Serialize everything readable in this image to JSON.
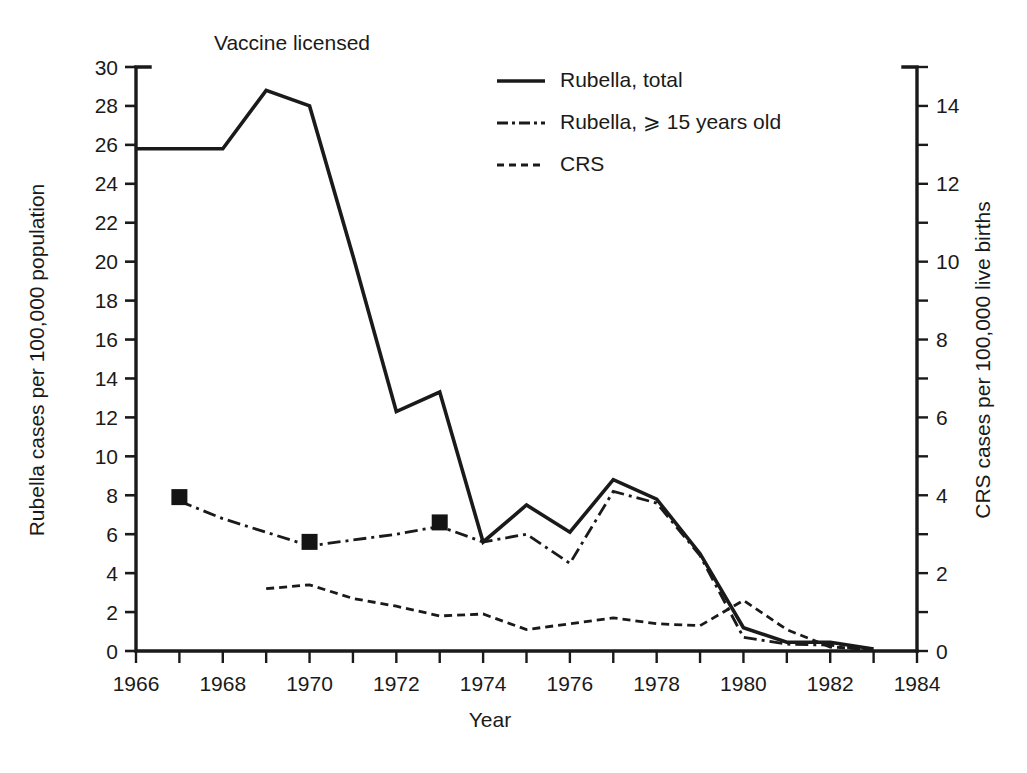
{
  "figure": {
    "annotation": "Vaccine licensed",
    "annotation_x_year": 1968.45
  },
  "axes": {
    "x": {
      "title": "Year",
      "ticks": [
        1966,
        1968,
        1970,
        1972,
        1974,
        1976,
        1978,
        1980,
        1982,
        1984
      ],
      "tick_labels": [
        "1966",
        "1968",
        "1970",
        "1972",
        "1974",
        "1976",
        "1978",
        "1980",
        "1982",
        "1984"
      ],
      "range": [
        1966,
        1984
      ],
      "minor_step": 1
    },
    "y_left": {
      "title": "Rubella cases per 100,000 population",
      "ticks": [
        0,
        2,
        4,
        6,
        8,
        10,
        12,
        14,
        16,
        18,
        20,
        22,
        24,
        26,
        28,
        30
      ],
      "tick_labels": [
        "0",
        "2",
        "4",
        "6",
        "8",
        "10",
        "12",
        "14",
        "16",
        "18",
        "20",
        "22",
        "24",
        "26",
        "28",
        "30"
      ],
      "range": [
        0,
        30
      ]
    },
    "y_right": {
      "title": "CRS cases per 100,000 live births",
      "ticks": [
        0,
        2,
        4,
        6,
        8,
        10,
        12,
        14
      ],
      "tick_labels": [
        "0",
        "2",
        "4",
        "6",
        "8",
        "10",
        "12",
        "14"
      ],
      "range": [
        0,
        15
      ],
      "minor_step": 1
    }
  },
  "legend": {
    "position": "top-right-inside",
    "entries": [
      {
        "label": "Rubella,  total",
        "style": "solid",
        "axis": "left"
      },
      {
        "label": "Rubella, ⩾ 15 years old",
        "style": "dash-dot",
        "axis": "left"
      },
      {
        "label": "CRS",
        "style": "dotted",
        "axis": "right"
      }
    ]
  },
  "colors": {
    "ink": "#1a1a1a",
    "background": "#ffffff"
  },
  "chart_data": {
    "type": "line",
    "title": "",
    "subtitle": "",
    "xlabel": "Year",
    "ylabel": "Rubella cases per 100,000 population",
    "ylabel_right": "CRS cases per 100,000 live births",
    "xlim": [
      1966,
      1984
    ],
    "ylim": [
      0,
      30
    ],
    "ylim_right": [
      0,
      15
    ],
    "grid": false,
    "legend_position": "upper right",
    "annotations": [
      {
        "text": "Vaccine licensed",
        "x": 1968.45,
        "y": 30.9
      }
    ],
    "x": [
      1966,
      1967,
      1968,
      1969,
      1970,
      1971,
      1972,
      1973,
      1974,
      1975,
      1976,
      1977,
      1978,
      1979,
      1980,
      1981,
      1982,
      1983
    ],
    "series": [
      {
        "name": "Rubella,  total",
        "style": "solid",
        "axis": "left",
        "units": "cases per 100,000 population",
        "x": [
          1966,
          1967,
          1968,
          1969,
          1970,
          1971,
          1972,
          1973,
          1974,
          1975,
          1976,
          1977,
          1978,
          1979,
          1980,
          1981,
          1982,
          1983
        ],
        "values": [
          25.8,
          25.8,
          25.8,
          28.8,
          28.0,
          20.3,
          12.3,
          13.3,
          5.6,
          7.5,
          6.1,
          8.8,
          7.8,
          5.0,
          1.2,
          0.45,
          0.45,
          0.1
        ]
      },
      {
        "name": "Rubella, ⩾ 15 years old",
        "style": "dash-dot",
        "axis": "left",
        "units": "cases per 100,000 population",
        "x": [
          1967,
          1968,
          1969,
          1970,
          1971,
          1972,
          1973,
          1974,
          1975,
          1976,
          1977,
          1978,
          1979,
          1980,
          1981,
          1982,
          1983
        ],
        "values": [
          7.7,
          6.8,
          6.1,
          5.4,
          5.7,
          6.0,
          6.4,
          5.6,
          6.0,
          4.5,
          8.2,
          7.6,
          4.9,
          0.7,
          0.35,
          0.3,
          0.0
        ],
        "markers": [
          {
            "x": 1967,
            "y": 7.7
          },
          {
            "x": 1970,
            "y": 5.4
          },
          {
            "x": 1973,
            "y": 6.4
          }
        ]
      },
      {
        "name": "CRS",
        "style": "dotted",
        "axis": "right",
        "units": "cases per 100,000 live births",
        "x": [
          1969,
          1970,
          1971,
          1972,
          1973,
          1974,
          1975,
          1976,
          1977,
          1978,
          1979,
          1980,
          1981,
          1982,
          1983
        ],
        "values_right_axis": [
          1.6,
          1.7,
          1.35,
          1.15,
          0.9,
          0.95,
          0.55,
          0.7,
          0.85,
          0.7,
          0.65,
          1.3,
          0.55,
          0.1,
          0.05
        ],
        "values_left_axis_equivalent": [
          3.2,
          3.4,
          2.7,
          2.3,
          1.8,
          1.9,
          1.1,
          1.4,
          1.7,
          1.4,
          1.3,
          2.6,
          1.1,
          0.2,
          0.1
        ]
      }
    ]
  }
}
